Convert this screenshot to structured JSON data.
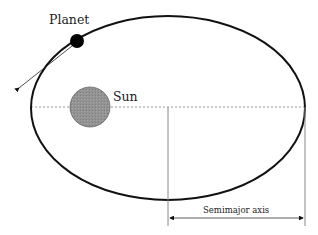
{
  "diagram": {
    "type": "orbital-ellipse",
    "labels": {
      "planet": "Planet",
      "sun": "Sun",
      "semimajor_axis": "Semimajor axis"
    },
    "colors": {
      "orbit": "#111111",
      "sun_fill": "#8f8f8f",
      "planet_fill": "#000000",
      "dashed_axis": "#999999",
      "measure_lines": "#777777"
    }
  }
}
